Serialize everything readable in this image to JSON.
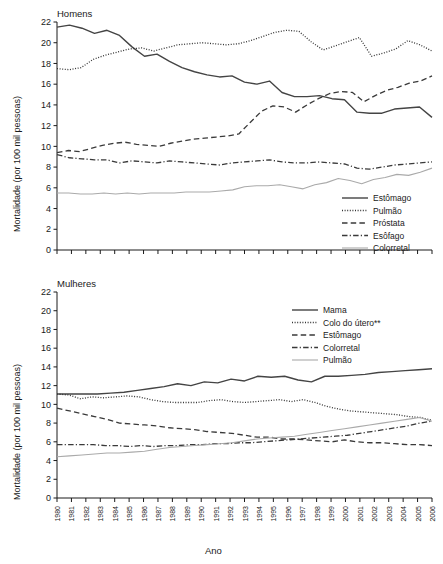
{
  "figure": {
    "xlabel": "Ano",
    "ylabel": "Mortalidade (por 100 mil pessoas)"
  },
  "chart_data": [
    {
      "type": "line",
      "title": "Homens",
      "xlabel": "",
      "ylabel": "Mortalidade (por 100 mil pessoas)",
      "ylim": [
        0,
        22
      ],
      "yticks": [
        0,
        2,
        4,
        6,
        8,
        10,
        12,
        14,
        16,
        18,
        20,
        22
      ],
      "grid": false,
      "legend_position": "lower-right",
      "x": [
        1980,
        1981,
        1982,
        1983,
        1984,
        1985,
        1986,
        1987,
        1988,
        1989,
        1990,
        1991,
        1992,
        1993,
        1994,
        1995,
        1996,
        1997,
        1998,
        1999,
        2000,
        2001,
        2002,
        2003,
        2004,
        2005,
        2006
      ],
      "categories": [
        "1980",
        "1981",
        "1982",
        "1983",
        "1984",
        "1985",
        "1986",
        "1987",
        "1988",
        "1989",
        "1990",
        "1991",
        "1992",
        "1993",
        "1994",
        "1995",
        "1996",
        "1997",
        "1998",
        "1999",
        "2000",
        "2001",
        "2002",
        "2003",
        "2004",
        "2005",
        "2006"
      ],
      "series": [
        {
          "name": "Estômago",
          "style": "solid",
          "color": "#444444",
          "values": [
            21.5,
            21.7,
            21.4,
            20.9,
            21.2,
            20.7,
            19.6,
            18.7,
            18.9,
            18.2,
            17.6,
            17.2,
            16.9,
            16.7,
            16.8,
            16.2,
            16.0,
            16.3,
            15.2,
            14.8,
            14.8,
            14.9,
            14.6,
            14.5,
            13.3,
            13.2,
            13.2,
            13.6,
            13.7,
            13.8,
            12.8
          ]
        },
        {
          "name": "Pulmão",
          "style": "dotted",
          "color": "#333333",
          "values": [
            17.5,
            17.4,
            17.6,
            18.4,
            18.8,
            19.1,
            19.4,
            19.5,
            19.2,
            19.5,
            19.8,
            19.9,
            20.0,
            19.9,
            19.8,
            19.9,
            20.2,
            20.6,
            21.0,
            21.2,
            21.1,
            20.1,
            19.3,
            19.7,
            20.1,
            20.5,
            18.7,
            19.0,
            19.4,
            20.2,
            19.8,
            19.2
          ]
        },
        {
          "name": "Próstata",
          "style": "dashed",
          "color": "#3a3a3a",
          "values": [
            9.4,
            9.6,
            9.5,
            9.8,
            10.1,
            10.3,
            10.4,
            10.2,
            10.1,
            10.0,
            10.3,
            10.5,
            10.7,
            10.8,
            10.9,
            11.0,
            11.2,
            12.3,
            13.4,
            13.9,
            13.8,
            13.3,
            14.0,
            14.6,
            15.1,
            15.3,
            15.2,
            14.3,
            14.9,
            15.4,
            15.7,
            16.1,
            16.3,
            16.8
          ]
        },
        {
          "name": "Esôfago",
          "style": "dashdot",
          "color": "#3a3a3a",
          "values": [
            9.2,
            8.9,
            8.8,
            8.7,
            8.7,
            8.4,
            8.6,
            8.5,
            8.4,
            8.6,
            8.5,
            8.4,
            8.3,
            8.2,
            8.4,
            8.5,
            8.6,
            8.7,
            8.5,
            8.4,
            8.4,
            8.5,
            8.4,
            8.3,
            7.9,
            7.8,
            8.0,
            8.2,
            8.3,
            8.4,
            8.5
          ]
        },
        {
          "name": "Colorretal",
          "style": "solid-light",
          "color": "#aaaaaa",
          "values": [
            5.5,
            5.5,
            5.4,
            5.4,
            5.5,
            5.4,
            5.5,
            5.4,
            5.5,
            5.5,
            5.5,
            5.6,
            5.6,
            5.6,
            5.7,
            5.8,
            6.1,
            6.2,
            6.2,
            6.3,
            6.1,
            5.9,
            6.3,
            6.5,
            6.9,
            6.7,
            6.4,
            6.8,
            7.0,
            7.3,
            7.2,
            7.5,
            7.9
          ]
        }
      ]
    },
    {
      "type": "line",
      "title": "Mulheres",
      "xlabel": "Ano",
      "ylabel": "Mortalidade (por 100 mil pessoas)",
      "ylim": [
        0,
        22
      ],
      "yticks": [
        0,
        2,
        4,
        6,
        8,
        10,
        12,
        14,
        16,
        18,
        20,
        22
      ],
      "grid": false,
      "legend_position": "upper-right",
      "x": [
        1980,
        1981,
        1982,
        1983,
        1984,
        1985,
        1986,
        1987,
        1988,
        1989,
        1990,
        1991,
        1992,
        1993,
        1994,
        1995,
        1996,
        1997,
        1998,
        1999,
        2000,
        2001,
        2002,
        2003,
        2004,
        2005,
        2006
      ],
      "categories": [
        "1980",
        "1981",
        "1982",
        "1983",
        "1984",
        "1985",
        "1986",
        "1987",
        "1988",
        "1989",
        "1990",
        "1991",
        "1992",
        "1993",
        "1994",
        "1995",
        "1996",
        "1997",
        "1998",
        "1999",
        "2000",
        "2001",
        "2002",
        "2003",
        "2004",
        "2005",
        "2006"
      ],
      "series": [
        {
          "name": "Mama",
          "style": "solid",
          "color": "#444444",
          "values": [
            11.1,
            11.1,
            11.1,
            11.1,
            11.2,
            11.3,
            11.5,
            11.7,
            11.9,
            12.2,
            12.0,
            12.4,
            12.3,
            12.7,
            12.5,
            13.0,
            12.9,
            13.0,
            12.6,
            12.4,
            13.0,
            13.0,
            13.1,
            13.2,
            13.4,
            13.5,
            13.6,
            13.7,
            13.8
          ]
        },
        {
          "name": "Colo do útero**",
          "style": "dotted",
          "color": "#333333",
          "values": [
            11.1,
            11.0,
            10.6,
            10.8,
            10.7,
            10.8,
            10.9,
            10.8,
            10.5,
            10.3,
            10.2,
            10.2,
            10.2,
            10.4,
            10.5,
            10.3,
            10.2,
            10.3,
            10.4,
            10.5,
            10.3,
            10.5,
            10.2,
            9.8,
            9.5,
            9.3,
            9.2,
            9.1,
            9.0,
            8.9,
            8.7,
            8.6,
            8.3
          ]
        },
        {
          "name": "Estômago",
          "style": "dashed",
          "color": "#3a3a3a",
          "values": [
            9.6,
            9.3,
            9.0,
            8.7,
            8.4,
            8.0,
            7.9,
            7.8,
            7.7,
            7.5,
            7.4,
            7.3,
            7.1,
            7.0,
            6.9,
            6.7,
            6.5,
            6.5,
            6.3,
            6.3,
            6.2,
            6.1,
            6.0,
            6.2,
            6.0,
            5.9,
            5.9,
            5.8,
            5.7,
            5.7,
            5.6
          ]
        },
        {
          "name": "Colorretal",
          "style": "dashdot",
          "color": "#3a3a3a",
          "values": [
            5.7,
            5.7,
            5.7,
            5.7,
            5.6,
            5.6,
            5.5,
            5.6,
            5.5,
            5.6,
            5.6,
            5.7,
            5.7,
            5.8,
            5.8,
            5.9,
            5.9,
            6.0,
            6.1,
            6.2,
            6.3,
            6.4,
            6.5,
            6.6,
            6.7,
            6.9,
            7.1,
            7.3,
            7.5,
            7.7,
            8.0,
            8.2
          ]
        },
        {
          "name": "Pulmão",
          "style": "solid-light",
          "color": "#aaaaaa",
          "values": [
            4.4,
            4.5,
            4.6,
            4.7,
            4.8,
            4.8,
            4.9,
            5.0,
            5.2,
            5.4,
            5.5,
            5.6,
            5.7,
            5.8,
            5.9,
            6.1,
            6.3,
            6.4,
            6.5,
            6.6,
            6.8,
            7.0,
            7.2,
            7.4,
            7.6,
            7.8,
            8.0,
            8.2,
            8.4,
            8.6,
            8.2
          ]
        }
      ]
    }
  ]
}
